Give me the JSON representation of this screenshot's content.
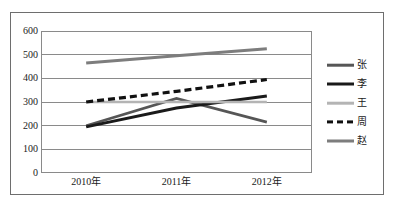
{
  "chart_data": {
    "type": "line",
    "title": "",
    "subtitle": "",
    "xlabel": "",
    "ylabel": "",
    "categories": [
      "2010年",
      "2011年",
      "2012年"
    ],
    "ylim": [
      0,
      600
    ],
    "yticks": [
      0,
      100,
      200,
      300,
      400,
      500,
      600
    ],
    "ytick_labels": [
      "0",
      "100",
      "200",
      "300",
      "400",
      "500",
      "600"
    ],
    "grid": true,
    "legend_position": "right",
    "series": [
      {
        "name": "张",
        "values": [
          200,
          315,
          215
        ],
        "color": "#565656",
        "style": "solid",
        "width": 2.6
      },
      {
        "name": "李",
        "values": [
          195,
          275,
          325
        ],
        "color": "#1a1a1a",
        "style": "solid",
        "width": 3.0
      },
      {
        "name": "王",
        "values": [
          300,
          300,
          300
        ],
        "color": "#b4b4b4",
        "style": "solid",
        "width": 2.6
      },
      {
        "name": "周",
        "values": [
          300,
          345,
          395
        ],
        "color": "#111111",
        "style": "dashed",
        "width": 3.2
      },
      {
        "name": "赵",
        "values": [
          465,
          495,
          525
        ],
        "color": "#7d7d7d",
        "style": "solid",
        "width": 3.0
      }
    ]
  },
  "legend": {
    "items": [
      {
        "label": "张"
      },
      {
        "label": "李"
      },
      {
        "label": "王"
      },
      {
        "label": "周"
      },
      {
        "label": "赵"
      }
    ]
  },
  "axes": {
    "x_labels": [
      "2010年",
      "2011年",
      "2012年"
    ],
    "y_labels": [
      "600",
      "500",
      "400",
      "300",
      "200",
      "100",
      "0"
    ]
  }
}
